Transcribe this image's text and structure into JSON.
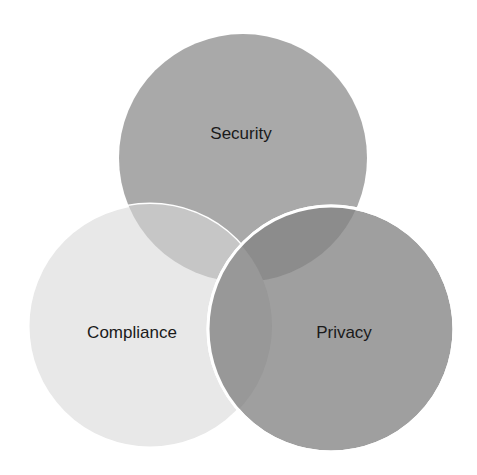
{
  "diagram": {
    "type": "venn",
    "sets": [
      {
        "label": "Security",
        "color": "#a9a9a9",
        "cx": 243,
        "cy": 158,
        "r": 124
      },
      {
        "label": "Compliance",
        "color": "#e6e6e6",
        "cx": 150,
        "cy": 326,
        "r": 122
      },
      {
        "label": "Privacy",
        "color": "#9d9d9d",
        "cx": 331,
        "cy": 329,
        "r": 123
      }
    ],
    "overlap_colors": {
      "security_compliance": "#c4c4c4",
      "security_privacy": "#8a8a8a"
    },
    "stroke_color": "#ffffff"
  }
}
